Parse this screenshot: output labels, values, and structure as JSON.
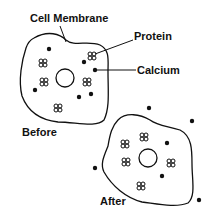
{
  "labels": {
    "cell_membrane": "Cell Membrane",
    "protein": "Protein",
    "calcium": "Calcium",
    "before": "Before",
    "after": "After"
  },
  "colors": {
    "ink": "#111111",
    "background": "#ffffff"
  },
  "icons": {
    "protein": "protein-cluster-icon",
    "calcium": "calcium-dot-icon",
    "nucleus": "nucleus-circle-icon"
  }
}
